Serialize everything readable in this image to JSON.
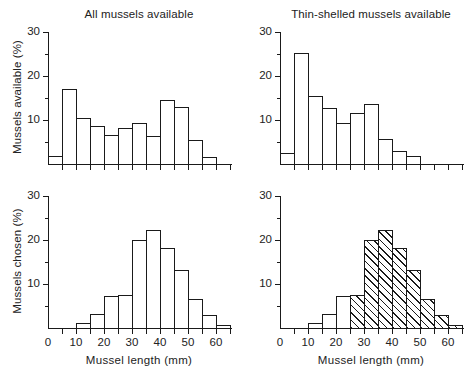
{
  "figure": {
    "xlabel": "Mussel length  (mm)",
    "x_ticks_major": [
      0,
      10,
      20,
      30,
      40,
      50,
      60
    ],
    "x_ticks_minor": [
      5,
      15,
      25,
      35,
      45,
      55,
      65
    ],
    "y_ticks_major": [
      0,
      10,
      20,
      30
    ],
    "y_ticks_minor": [
      5,
      15,
      25
    ],
    "xlim": [
      0,
      65
    ],
    "ylim": [
      0,
      30
    ],
    "bin_width": 5,
    "colors": {
      "ink": "#1a1a1a",
      "background": "#ffffff",
      "hatch": "#1a1a1a"
    }
  },
  "panels": [
    {
      "id": "top-left",
      "title": "All mussels available",
      "ylabel": "Mussels available (%)",
      "show_title": true,
      "show_ylabel": true,
      "show_xaxis_labels": false,
      "show_xlabel": false
    },
    {
      "id": "top-right",
      "title": "Thin-shelled mussels available",
      "ylabel": "",
      "show_title": true,
      "show_ylabel": false,
      "show_xaxis_labels": false,
      "show_xlabel": false
    },
    {
      "id": "bottom-left",
      "title": "",
      "ylabel": "Mussels chosen (%)",
      "show_title": false,
      "show_ylabel": true,
      "show_xaxis_labels": true,
      "show_xlabel": true
    },
    {
      "id": "bottom-right",
      "title": "",
      "ylabel": "",
      "show_title": false,
      "show_ylabel": false,
      "show_xaxis_labels": true,
      "show_xlabel": true
    }
  ],
  "chart_data": [
    {
      "type": "bar",
      "panel": "top-left",
      "title": "All mussels available",
      "xlabel": "Mussel length  (mm)",
      "ylabel": "Mussels available (%)",
      "xlim": [
        0,
        65
      ],
      "ylim": [
        0,
        30
      ],
      "grid": false,
      "legend": null,
      "bin_edges": [
        0,
        5,
        10,
        15,
        20,
        25,
        30,
        35,
        40,
        45,
        50,
        55,
        60,
        65
      ],
      "categories": [
        "0-5",
        "5-10",
        "10-15",
        "15-20",
        "20-25",
        "25-30",
        "30-35",
        "35-40",
        "40-45",
        "45-50",
        "50-55",
        "55-60",
        "60-65"
      ],
      "values": [
        1.5,
        16.7,
        10.2,
        8.3,
        6.3,
        7.8,
        9.1,
        6.1,
        14.2,
        12.7,
        5.2,
        1.2,
        0
      ],
      "hatched": [
        false,
        false,
        false,
        false,
        false,
        false,
        false,
        false,
        false,
        false,
        false,
        false,
        false
      ]
    },
    {
      "type": "bar",
      "panel": "top-right",
      "title": "Thin-shelled mussels available",
      "xlabel": "Mussel length  (mm)",
      "ylabel": "Mussels available (%)",
      "xlim": [
        0,
        65
      ],
      "ylim": [
        0,
        30
      ],
      "grid": false,
      "legend": null,
      "bin_edges": [
        0,
        5,
        10,
        15,
        20,
        25,
        30,
        35,
        40,
        45,
        50,
        55,
        60,
        65
      ],
      "categories": [
        "0-5",
        "5-10",
        "10-15",
        "15-20",
        "20-25",
        "25-30",
        "30-35",
        "35-40",
        "40-45",
        "45-50",
        "50-55",
        "55-60",
        "60-65"
      ],
      "values": [
        2.3,
        25.0,
        15.1,
        12.4,
        9.0,
        11.4,
        13.4,
        5.5,
        2.7,
        1.5,
        0,
        0,
        0
      ],
      "hatched": [
        false,
        false,
        false,
        false,
        false,
        false,
        false,
        false,
        false,
        false,
        false,
        false,
        false
      ]
    },
    {
      "type": "bar",
      "panel": "bottom-left",
      "title": "",
      "xlabel": "Mussel length  (mm)",
      "ylabel": "Mussels chosen (%)",
      "xlim": [
        0,
        65
      ],
      "ylim": [
        0,
        30
      ],
      "grid": false,
      "legend": null,
      "bin_edges": [
        0,
        5,
        10,
        15,
        20,
        25,
        30,
        35,
        40,
        45,
        50,
        55,
        60,
        65
      ],
      "categories": [
        "0-5",
        "5-10",
        "10-15",
        "15-20",
        "20-25",
        "25-30",
        "30-35",
        "35-40",
        "40-45",
        "45-50",
        "50-55",
        "55-60",
        "60-65"
      ],
      "values": [
        0,
        0,
        0.9,
        3.0,
        7.0,
        7.3,
        19.8,
        21.9,
        17.9,
        13.0,
        6.3,
        2.6,
        0.5
      ],
      "hatched": [
        false,
        false,
        false,
        false,
        false,
        false,
        false,
        false,
        false,
        false,
        false,
        false,
        false
      ]
    },
    {
      "type": "bar",
      "panel": "bottom-right",
      "title": "",
      "xlabel": "Mussel length  (mm)",
      "ylabel": "Mussels chosen (%)",
      "xlim": [
        0,
        65
      ],
      "ylim": [
        0,
        30
      ],
      "grid": false,
      "legend": null,
      "bin_edges": [
        0,
        5,
        10,
        15,
        20,
        25,
        30,
        35,
        40,
        45,
        50,
        55,
        60,
        65
      ],
      "categories": [
        "0-5",
        "5-10",
        "10-15",
        "15-20",
        "20-25",
        "25-30",
        "30-35",
        "35-40",
        "40-45",
        "45-50",
        "50-55",
        "55-60",
        "60-65"
      ],
      "values": [
        0,
        0,
        0.9,
        3.0,
        7.0,
        7.3,
        19.8,
        21.9,
        17.9,
        13.0,
        6.3,
        2.6,
        0.5
      ],
      "hatched": [
        false,
        false,
        false,
        false,
        false,
        true,
        true,
        true,
        true,
        true,
        true,
        true,
        true
      ]
    }
  ]
}
